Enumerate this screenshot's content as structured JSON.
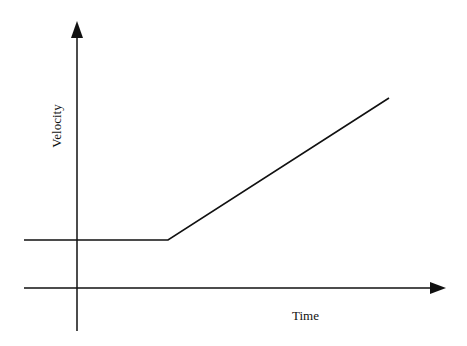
{
  "diagram": {
    "type": "velocity-time-graph",
    "axes": {
      "y_label": "Velocity",
      "x_label": "Time"
    },
    "geometry": {
      "y_axis": {
        "x": 77,
        "top": 21,
        "bottom": 331
      },
      "x_axis": {
        "y": 288,
        "left": 24,
        "right": 445
      },
      "curve_points": [
        [
          24,
          240
        ],
        [
          168,
          240
        ],
        [
          389,
          98
        ]
      ]
    },
    "colors": {
      "line": "#111111",
      "background": "#ffffff"
    }
  }
}
